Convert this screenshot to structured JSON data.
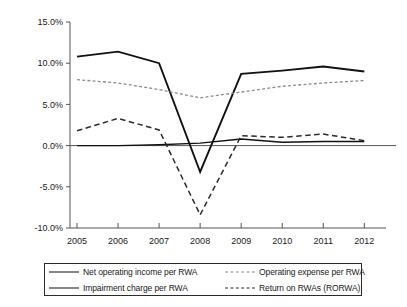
{
  "chart_data": {
    "type": "line",
    "title": "",
    "xlabel": "",
    "ylabel": "",
    "categories": [
      "2005",
      "2006",
      "2007",
      "2008",
      "2009",
      "2010",
      "2011",
      "2012"
    ],
    "ylim": [
      -10,
      15
    ],
    "ytick_labels": [
      "15.0%",
      "10.0%",
      "5.0%",
      "0.0%",
      "-5.0%",
      "-10.0%"
    ],
    "ytick_values": [
      15,
      10,
      5,
      0,
      -5,
      -10
    ],
    "grid": false,
    "legend_position": "bottom",
    "series": [
      {
        "name": "Net operating income per RWA",
        "style": "solid-thick",
        "color": "#111111",
        "values": [
          10.8,
          11.4,
          10.0,
          -3.2,
          8.7,
          9.1,
          9.6,
          9.0
        ]
      },
      {
        "name": "Operating expense per RWA",
        "style": "dotted",
        "color": "#8d8d8d",
        "values": [
          8.0,
          7.6,
          6.8,
          5.8,
          6.5,
          7.2,
          7.6,
          7.9
        ]
      },
      {
        "name": "Impairment charge per RWA",
        "style": "solid-thin",
        "color": "#111111",
        "values": [
          0.0,
          0.0,
          0.1,
          0.3,
          0.8,
          0.4,
          0.5,
          0.5
        ]
      },
      {
        "name": "Return on RWAs (RORWA)",
        "style": "dashed",
        "color": "#2b2b2b",
        "values": [
          1.8,
          3.3,
          1.9,
          -8.4,
          1.2,
          1.0,
          1.4,
          0.6
        ]
      }
    ]
  },
  "legend": {
    "entries": [
      {
        "label": "Net operating income per RWA",
        "style": "solid-thick"
      },
      {
        "label": "Operating expense per RWA",
        "style": "dotted"
      },
      {
        "label": "Impairment charge per RWA",
        "style": "solid-thin"
      },
      {
        "label": "Return on RWAs (RORWA)",
        "style": "dashed"
      }
    ]
  }
}
